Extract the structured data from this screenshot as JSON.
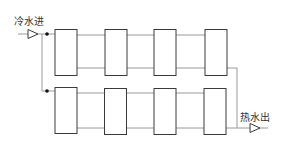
{
  "diagram": {
    "inlet_label": "冷水进",
    "outlet_label": "热水出",
    "colors": {
      "box_stroke": "#3a3a3a",
      "pipe_stroke": "#9a9a9a",
      "text": "#333333",
      "background": "#ffffff"
    },
    "rows": [
      {
        "name": "top-row",
        "units": 4
      },
      {
        "name": "bottom-row",
        "units": 4
      }
    ]
  }
}
